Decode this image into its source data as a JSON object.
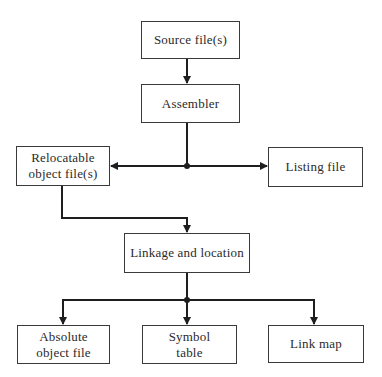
{
  "diagram": {
    "title": "",
    "colors": {
      "line": "#1e1e1e",
      "border": "#3a3a3a",
      "text": "#2a2a2a",
      "background": "#ffffff"
    },
    "nodes": [
      {
        "id": "source",
        "label": "Source file(s)"
      },
      {
        "id": "assembler",
        "label": "Assembler"
      },
      {
        "id": "relocatable",
        "label": "Relocatable\nobject file(s)"
      },
      {
        "id": "listing",
        "label": "Listing file"
      },
      {
        "id": "linkage",
        "label": "Linkage and location"
      },
      {
        "id": "absolute",
        "label": "Absolute\nobject file"
      },
      {
        "id": "symbol",
        "label": "Symbol\ntable"
      },
      {
        "id": "linkmap",
        "label": "Link map"
      }
    ],
    "edges": [
      {
        "from": "source",
        "to": "assembler"
      },
      {
        "from": "assembler",
        "to": "relocatable"
      },
      {
        "from": "assembler",
        "to": "listing"
      },
      {
        "from": "relocatable",
        "to": "linkage"
      },
      {
        "from": "linkage",
        "to": "absolute"
      },
      {
        "from": "linkage",
        "to": "symbol"
      },
      {
        "from": "linkage",
        "to": "linkmap"
      }
    ]
  }
}
